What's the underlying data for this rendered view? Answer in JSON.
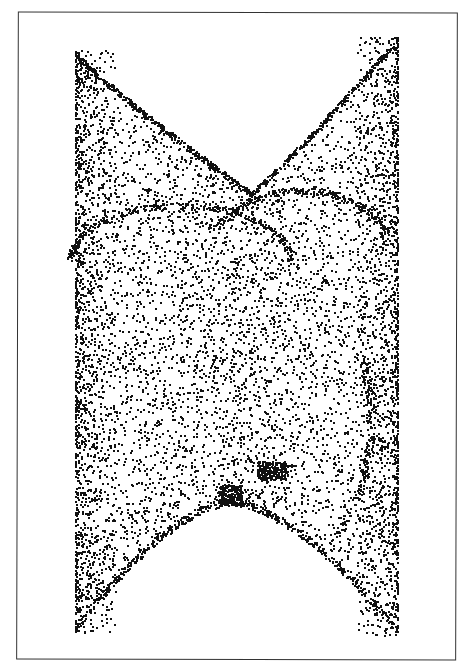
{
  "chart_data": {
    "type": "scatter",
    "title": "",
    "xlabel": "",
    "ylabel": "",
    "grid": false,
    "legend": null,
    "point_color": "#111111",
    "background": "#ffffff",
    "frame": {
      "x": 17,
      "y": 12,
      "w": 440,
      "h": 648
    },
    "extent_px": {
      "x_min": 68,
      "x_max": 404,
      "y_min": 36,
      "y_max": 635
    },
    "structure": {
      "left_edge_x": 75,
      "right_edge_x": 397,
      "left_top_y": 50,
      "right_top_y": 36,
      "left_bottom_y": 632,
      "right_bottom_y": 635,
      "top_valley": {
        "x": 250,
        "y": 190
      },
      "bottom_arch_peak": {
        "x": 230,
        "y": 505
      },
      "dense_blob": {
        "x": 272,
        "y": 470
      }
    },
    "n_points": 9000,
    "seed": 7
  }
}
